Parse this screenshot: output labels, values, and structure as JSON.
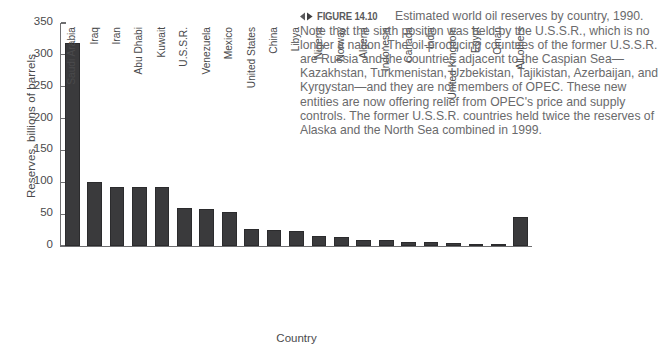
{
  "figure": {
    "marker_icon": "left-right-diamond-icon",
    "number_label": "FIGURE 14.10",
    "caption_text": "Estimated world oil reserves by country, 1990. Note that the sixth position was held by the U.S.S.R., which is no longer a nation. The oil-producing countries of the former U.S.S.R. are Russia and the countries adjacent to the Caspian Sea—Kazakhstan, Turkmenistan, Uzbekistan, Tajikistan, Azerbaijan, and Kyrgystan—and they are not members of OPEC. These new entities are now offering relief from OPEC's price and supply controls. The former U.S.S.R. countries held twice the reserves of Alaska and the North Sea combined in 1999."
  },
  "chart_data": {
    "type": "bar",
    "title": "",
    "xlabel": "Country",
    "ylabel": "Reserves, billions of barrels",
    "ylim": [
      0,
      350
    ],
    "yticks": [
      0,
      50,
      100,
      150,
      200,
      250,
      300,
      350
    ],
    "grid": false,
    "legend": "none",
    "bar_color": "#3a3a3c",
    "categories": [
      "Saudi Arabia",
      "Iraq",
      "Iran",
      "Abu Dhabi",
      "Kuwait",
      "U.S.S.R.",
      "Venezuela",
      "Mexico",
      "United States",
      "China",
      "Libya",
      "Nigeria",
      "Norway",
      "Algeria",
      "Indonesia",
      "Canada",
      "India",
      "United Kingdom",
      "Egypt",
      "Oman",
      "All others"
    ],
    "values": [
      318,
      100,
      93,
      92,
      92,
      59,
      58,
      54,
      26,
      25,
      23,
      16,
      14,
      10,
      9,
      7,
      6,
      4,
      3,
      3,
      45
    ]
  }
}
